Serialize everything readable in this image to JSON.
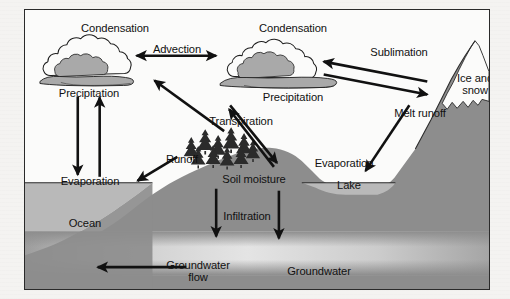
{
  "diagram": {
    "title_visible": false,
    "frame": {
      "border_color": "#2a2a2a",
      "background": "#fbfbfa"
    },
    "palette": {
      "ink": "#111111",
      "sky": "#fbfbfa",
      "cloud_fill": "#a9a9a9",
      "cloud_outline": "#1d1d1d",
      "ocean": "#b9b9b9",
      "land": "#8d8d8d",
      "mountain": "#8d8d8d",
      "snow": "#fbfbfa",
      "aquifer": "#d8d8d8",
      "tree": "#2b2b2b"
    },
    "labels": {
      "condensation_left": "Condensation",
      "condensation_right": "Condensation",
      "advection": "Advection",
      "sublimation": "Sublimation",
      "precipitation_left": "Precipitation",
      "precipitation_right": "Precipitation",
      "ice_and_snow": "Ice and snow",
      "transpiration": "Transpiration",
      "melt_runoff": "Melt runoff",
      "evaporation_left": "Evaporation",
      "evaporation_right": "Evaporation",
      "runoff": "Runoff",
      "soil_moisture": "Soil moisture",
      "lake": "Lake",
      "ocean": "Ocean",
      "infiltration": "Infiltration",
      "groundwater_flow": "Groundwater flow",
      "groundwater": "Groundwater"
    },
    "features": [
      {
        "name": "cloud-left",
        "kind": "cloud"
      },
      {
        "name": "cloud-right",
        "kind": "cloud"
      },
      {
        "name": "mountain",
        "kind": "terrain"
      },
      {
        "name": "snow-cap",
        "kind": "terrain"
      },
      {
        "name": "ocean",
        "kind": "water"
      },
      {
        "name": "lake",
        "kind": "water"
      },
      {
        "name": "aquifer",
        "kind": "water"
      },
      {
        "name": "tree-cluster",
        "kind": "vegetation"
      }
    ],
    "arrows": [
      {
        "name": "advection-arrow",
        "label": "Advection",
        "direction": "bidirectional"
      },
      {
        "name": "sublimation-arrow",
        "label": "Sublimation",
        "direction": "to-cloud"
      },
      {
        "name": "snowfall-arrow",
        "label": "",
        "direction": "to-mountain"
      },
      {
        "name": "precipitation-left-arrow",
        "label": "Precipitation",
        "direction": "down"
      },
      {
        "name": "evaporation-left-arrow",
        "label": "Evaporation",
        "direction": "up"
      },
      {
        "name": "transpiration-arrow",
        "label": "Transpiration",
        "direction": "up-left"
      },
      {
        "name": "precipitation-right-arrow",
        "label": "Precipitation",
        "direction": "down-right"
      },
      {
        "name": "evaporation-right-arrow",
        "label": "Evaporation",
        "direction": "up-left"
      },
      {
        "name": "melt-runoff-arrow",
        "label": "Melt runoff",
        "direction": "down-left"
      },
      {
        "name": "runoff-arrow",
        "label": "Runoff",
        "direction": "down-left"
      },
      {
        "name": "infiltration-arrow-1",
        "label": "Infiltration",
        "direction": "down"
      },
      {
        "name": "infiltration-arrow-2",
        "label": "Infiltration",
        "direction": "down"
      },
      {
        "name": "groundwater-flow-arrow",
        "label": "Groundwater flow",
        "direction": "left"
      }
    ]
  },
  "background_text": {
    "line1": "",
    "line2": "",
    "line3": ""
  }
}
